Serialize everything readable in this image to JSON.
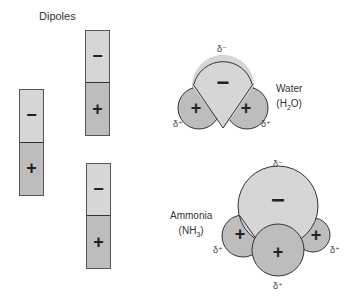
{
  "title": "Dipoles",
  "dipoles": [
    {
      "id": "left",
      "negative_sign": "−",
      "positive_sign": "+"
    },
    {
      "id": "top-middle",
      "negative_sign": "−",
      "positive_sign": "+"
    },
    {
      "id": "bottom-middle",
      "negative_sign": "−",
      "positive_sign": "+"
    }
  ],
  "water": {
    "name": "Water",
    "formula_prefix": "(H",
    "formula_sub": "2",
    "formula_suffix": "O)",
    "delta_top": "δ⁻",
    "delta_left": "δ⁺",
    "delta_right": "δ⁺",
    "center_sign": "−",
    "left_sign": "+",
    "right_sign": "+"
  },
  "ammonia": {
    "name": "Ammonia",
    "formula_prefix": "(NH",
    "formula_sub": "3",
    "formula_suffix": ")",
    "delta_top": "δ⁻",
    "delta_left": "δ⁺",
    "delta_right": "δ⁺",
    "delta_bottom": "δ⁺",
    "center_sign": "−",
    "left_sign": "+",
    "right_sign": "+",
    "front_sign": "+"
  },
  "colors": {
    "negative_fill": "#d6d6d6",
    "positive_fill": "#bdbdbd",
    "outline": "#333333"
  }
}
